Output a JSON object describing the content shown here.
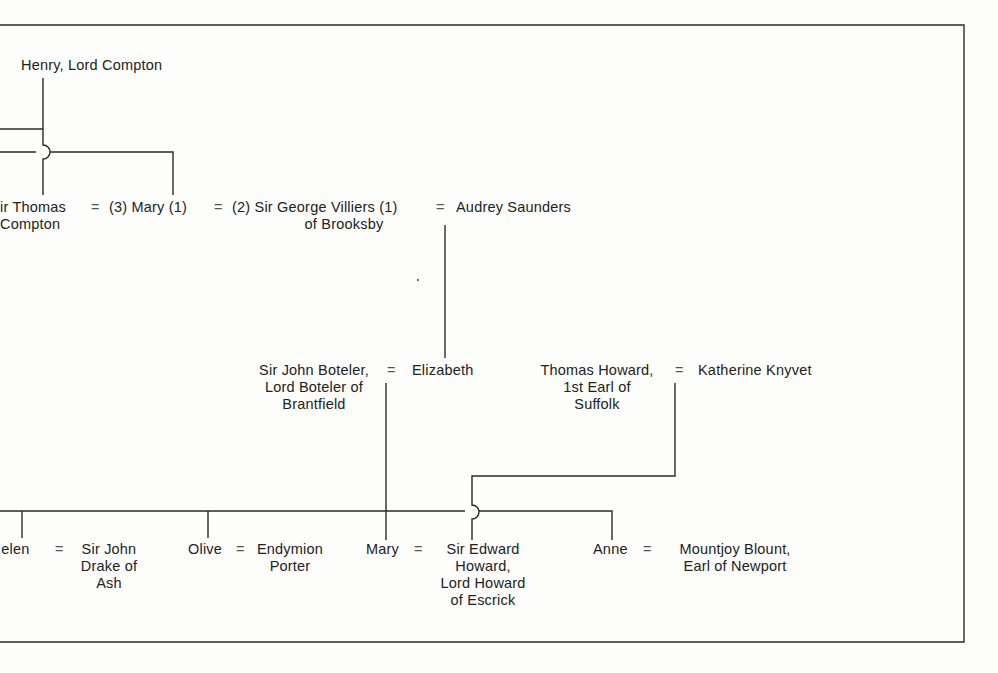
{
  "diagram": {
    "type": "family-tree",
    "row1": {
      "henry": "Henry, Lord Compton"
    },
    "row2": {
      "thomas_line1": "ir Thomas",
      "thomas_line2": "Compton",
      "eq1": "=",
      "mary_mid": "(3) Mary (1)",
      "eq2": "=",
      "george_line1": "(2) Sir George Villiers (1)",
      "george_line2": "of Brooksby",
      "eq3": "=",
      "audrey": "Audrey Saunders"
    },
    "row3": {
      "boteler_line1": "Sir John Boteler,",
      "boteler_line2": "Lord Boteler of",
      "boteler_line3": "Brantfield",
      "eq1": "=",
      "elizabeth": "Elizabeth",
      "howard_line1": "Thomas Howard,",
      "howard_line2": "1st Earl of",
      "howard_line3": "Suffolk",
      "eq2": "=",
      "katherine": "Katherine Knyvet"
    },
    "row4": {
      "helen": "Helen",
      "helen_visible": "Ielen",
      "eq1": "=",
      "drake_line1": "Sir John",
      "drake_line2": "Drake of",
      "drake_line3": "Ash",
      "olive": "Olive",
      "eq2": "=",
      "porter_line1": "Endymion",
      "porter_line2": "Porter",
      "mary": "Mary",
      "eq3": "=",
      "edward_line1": "Sir Edward",
      "edward_line2": "Howard,",
      "edward_line3": "Lord Howard",
      "edward_line4": "of Escrick",
      "anne": "Anne",
      "eq4": "=",
      "blount_line1": "Mountjoy Blount,",
      "blount_line2": "Earl of Newport"
    }
  }
}
